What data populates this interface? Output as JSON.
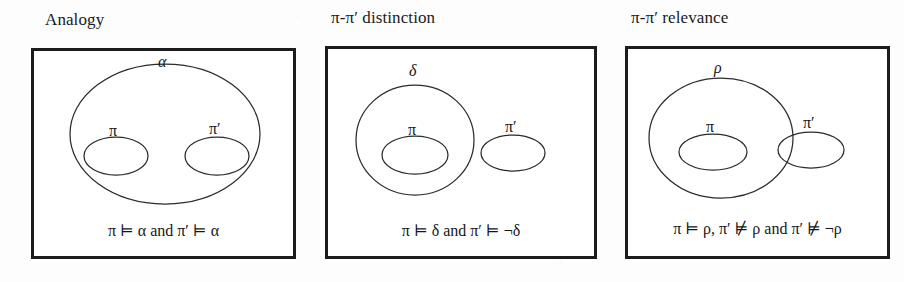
{
  "figure": {
    "background_color": "#fdfdfd",
    "ink_color": "#1c1c1c",
    "panel_count": 3
  },
  "panels": [
    {
      "id": "analogy",
      "title": "Analogy",
      "outer_label": "α",
      "left_label": "π",
      "right_label": "π′",
      "caption": "π ⊨ α and π′ ⊨ α"
    },
    {
      "id": "pi-pi-prime-distinction",
      "title": "π-π′ distinction",
      "outer_label": "δ",
      "left_label": "π",
      "right_label": "π′",
      "caption": "π ⊨ δ and π′ ⊨ ¬δ"
    },
    {
      "id": "pi-pi-prime-relevance",
      "title": "π-π′ relevance",
      "outer_label": "ρ",
      "left_label": "π",
      "right_label": "π′",
      "caption": "π ⊨ ρ, π′ ⊭ ρ and π′ ⊭ ¬ρ"
    }
  ],
  "diagram_data": {
    "type": "venn-set-diagram",
    "description": "Three boxed Euler/Venn style diagrams showing containment relations between an outer set and two inner sets labelled pi and pi-prime.",
    "panels": [
      {
        "id": "analogy",
        "shapes": [
          {
            "name": "outer-ellipse",
            "label": "α",
            "cx": 131,
            "cy": 83,
            "rx": 95,
            "ry": 70
          },
          {
            "name": "pi-ellipse",
            "label": "π",
            "cx": 82,
            "cy": 105,
            "rx": 32,
            "ry": 19
          },
          {
            "name": "pi-prime-ellipse",
            "label": "π′",
            "cx": 183,
            "cy": 105,
            "rx": 32,
            "ry": 19
          }
        ],
        "relations": [
          "pi inside alpha",
          "pi-prime inside alpha",
          "pi disjoint from pi-prime"
        ]
      },
      {
        "id": "pi-pi-prime-distinction",
        "shapes": [
          {
            "name": "outer-ellipse",
            "label": "δ",
            "cx": 87,
            "cy": 91,
            "rx": 59,
            "ry": 55
          },
          {
            "name": "pi-ellipse",
            "label": "π",
            "cx": 87,
            "cy": 106,
            "rx": 33,
            "ry": 19
          },
          {
            "name": "pi-prime-ellipse",
            "label": "π′",
            "cx": 185,
            "cy": 104,
            "rx": 32,
            "ry": 18
          }
        ],
        "relations": [
          "pi inside delta",
          "pi-prime outside delta"
        ]
      },
      {
        "id": "pi-pi-prime-relevance",
        "shapes": [
          {
            "name": "outer-ellipse",
            "label": "ρ",
            "cx": 93,
            "cy": 89,
            "rx": 72,
            "ry": 60
          },
          {
            "name": "pi-ellipse",
            "label": "π",
            "cx": 85,
            "cy": 103,
            "rx": 34,
            "ry": 18
          },
          {
            "name": "pi-prime-ellipse",
            "label": "π′",
            "cx": 183,
            "cy": 101,
            "rx": 33,
            "ry": 18
          }
        ],
        "relations": [
          "pi inside rho",
          "pi-prime overlaps rho boundary"
        ]
      }
    ]
  }
}
